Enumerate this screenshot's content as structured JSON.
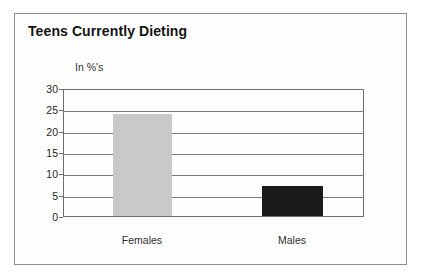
{
  "chart_data": {
    "type": "bar",
    "title": "Teens Currently Dieting",
    "unit_label": "In %'s",
    "categories": [
      "Females",
      "Males"
    ],
    "values": [
      24,
      7
    ],
    "bar_colors": [
      "#c9c9c9",
      "#1b1b1b"
    ],
    "xlabel": "",
    "ylabel": "In %'s",
    "ylim": [
      0,
      30
    ],
    "yticks": [
      0,
      5,
      10,
      15,
      20,
      25,
      30
    ],
    "grid": true,
    "legend": "none"
  },
  "colors": {
    "frame_border": "#8e8e8e",
    "plot_border": "#6e6e6e",
    "gridline": "#7b7b7b",
    "title_text": "#141414",
    "label_text": "#2f2f2f",
    "background": "#fefefe"
  }
}
